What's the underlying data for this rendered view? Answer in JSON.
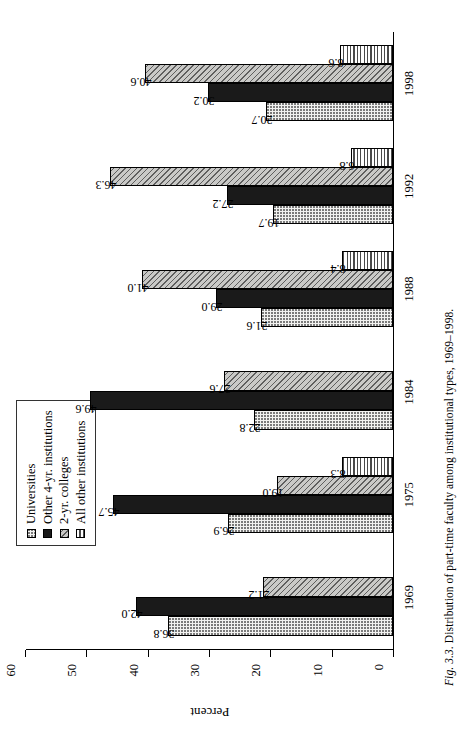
{
  "figure": {
    "caption_prefix": "Fig. 3.3.",
    "caption_text": "Distribution of part-time faculty among institutional types, 1969–1998."
  },
  "legend": {
    "items": [
      {
        "label": "Universities",
        "pattern": "dotted",
        "color": "#f2f2f0"
      },
      {
        "label": "Other 4-yr. institutions",
        "pattern": "solid-black",
        "color": "#1a1a1a"
      },
      {
        "label": "2-yr. colleges",
        "pattern": "diagonal-hatch",
        "color": "#c9c9c7"
      },
      {
        "label": "All other institutions",
        "pattern": "horizontal-lines",
        "color": "#ffffff"
      }
    ]
  },
  "axes": {
    "ylabel": "Percent",
    "yticks": [
      "0",
      "10",
      "20",
      "30",
      "40",
      "50",
      "60"
    ],
    "ymin": 0,
    "ymax": 60
  },
  "chart_data": {
    "type": "bar",
    "title": "",
    "subtitle": "",
    "xlabel": "",
    "ylabel": "Percent",
    "ylim": [
      0,
      60
    ],
    "grid": false,
    "legend_position": "top-left",
    "orientation": "vertical-bars-rotated-90",
    "categories": [
      "1969",
      "1975",
      "1984",
      "1988",
      "1992",
      "1998"
    ],
    "series": [
      {
        "name": "Universities",
        "values": [
          36.8,
          26.9,
          22.8,
          21.6,
          19.7,
          20.7
        ],
        "labels": [
          "36.8",
          "26.9",
          "22.8",
          "21.6",
          "19.7",
          "20.7"
        ]
      },
      {
        "name": "Other 4-yr. institutions",
        "values": [
          42.0,
          45.7,
          49.6,
          29.0,
          27.2,
          30.2
        ],
        "labels": [
          "42.0",
          "45.7",
          "49.6",
          "29.0",
          "27.2",
          "30.2"
        ]
      },
      {
        "name": "2-yr. colleges",
        "values": [
          21.2,
          19.0,
          27.6,
          41.0,
          46.3,
          40.6
        ],
        "labels": [
          "21.2",
          "19.0",
          "27.6",
          "41.0",
          "46.3",
          "40.6"
        ]
      },
      {
        "name": "All other institutions",
        "values": [
          null,
          8.3,
          null,
          8.4,
          6.8,
          8.6
        ],
        "labels": [
          "",
          "8.3",
          "",
          "8.4",
          "6.8",
          "8.6"
        ]
      }
    ],
    "annotations": "Each bar is labeled with its percent value; 1969 and 1984 have no 'All other institutions' bar."
  }
}
